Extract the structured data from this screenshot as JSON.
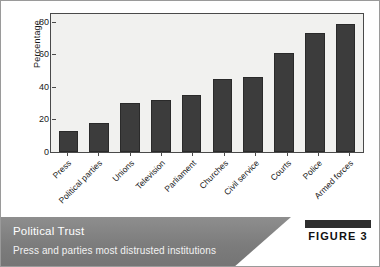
{
  "chart_data": {
    "type": "bar",
    "title": "Political Trust",
    "subtitle": "Press and parties most distrusted institutions",
    "xlabel": "",
    "ylabel": "Percentage",
    "ylim": [
      0,
      85
    ],
    "yticks": [
      0,
      20,
      40,
      60,
      80
    ],
    "grid": false,
    "legend": null,
    "categories": [
      "Press",
      "Political parties",
      "Unions",
      "Television",
      "Parliament",
      "Churches",
      "Civil service",
      "Courts",
      "Police",
      "Armed forces"
    ],
    "values": [
      13,
      18,
      30,
      32,
      35,
      45,
      46,
      61,
      73,
      79
    ],
    "bar_color": "#3c3c3c",
    "plot_background": "#f1f1ef"
  },
  "caption": {
    "title": "Political Trust",
    "subtitle": "Press and parties most distrusted institutions",
    "band_color": "#7c7c7c"
  },
  "badge": {
    "label": "FIGURE 3",
    "bar_color": "#2e2e2e"
  }
}
